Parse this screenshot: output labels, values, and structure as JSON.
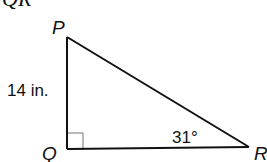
{
  "header": {
    "partial_text": "QR"
  },
  "triangle": {
    "vertices": {
      "P": {
        "label": "P",
        "x": 67,
        "y": 37
      },
      "Q": {
        "label": "Q",
        "x": 67,
        "y": 149
      },
      "R": {
        "label": "R",
        "x": 249,
        "y": 147
      }
    },
    "side_PQ_label": "14 in.",
    "angle_R_label": "31°",
    "right_angle_at": "Q",
    "colors": {
      "stroke": "#111111",
      "right_angle_marker": "#8a8a8a"
    }
  }
}
